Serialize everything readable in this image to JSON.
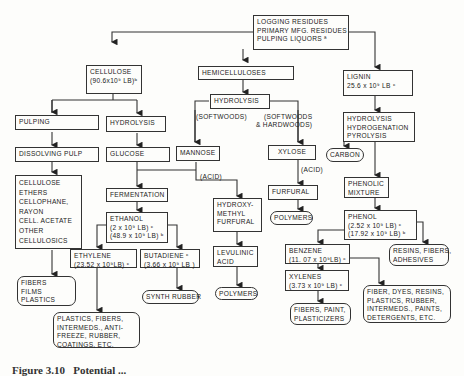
{
  "diagram": {
    "nodes": {
      "source": "LOGGING RESIDUES\nPRIMARY MFG. RESIDUES\nPULPING LIQUORS ª",
      "cellulose": "CELLULOSE\n(90.6x10⁹ LB)ᵇ",
      "hemicelluloses": "HEMICELLULOSES",
      "lignin": "LIGNIN\n25.6 x 10⁹ LB ᶜ",
      "pulping": "PULPING",
      "hydrolysis_cell": "HYDROLYSIS",
      "hydrolysis_hemi": "HYDROLYSIS",
      "lignin_process": "HYDROLYSIS\nHYDROGENATION\nPYROLYSIS",
      "dissolving_pulp": "DISSOLVING PULP",
      "glucose": "GLUCOSE",
      "mannose": "MANNOSE",
      "xylose": "XYLOSE",
      "carbon": "CARBON",
      "cellulosics": "CELLULOSE\nETHERS\nCELLOPHANE,\nRAYON\nCELL. ACETATE\nOTHER\nCELLULOSICS",
      "fermentation": "FERMENTATION",
      "hmf": "HYDROXY-\nMETHYL\nFURFURAL",
      "furfural": "FURFURAL",
      "polymers_furfural": "POLYMERS",
      "phenolic_mixture": "PHENOLIC\nMIXTURE",
      "ethanol": "ETHANOL\n(2 x 10⁹ LB) ᶜ\n(48.9 x 10⁹ LB) ᵇ",
      "levulinic": "LEVULINIC\nACID",
      "phenol": "PHENOL\n(2.52 x 10⁹ LB) ᶜ\n(17.92 x 10⁹ LB) ᵇ",
      "ethylene": "ETHYLENE\n(23.52 x 10⁹LB) ᶜ",
      "butadiene": "BUTADIENE ᶜ\n(3.66 x 10⁹ LB )",
      "polymers_levulinic": "POLYMERS",
      "benzene": "BENZENE\n(11. 07 x 10⁹LB) ᶜ",
      "resins": "RESINS, FIBERS,\nADHESIVES",
      "fibers_films": "FIBERS\nFILMS\nPLASTICS",
      "synth_rubber": "SYNTH RUBBER",
      "xylenes": "XYLENES\n(3.73 x 10⁹ LB) ᶜ",
      "fiber_dyes": "FIBER, DYES, RESINS,\nPLASTICS, RUBBER,\nINTERMEDS., PAINTS,\nDETERGENTS, ETC.",
      "fibers_paint": "FIBERS, PAINT,\nPLASTICIZERS",
      "plastics_fibers": "PLASTICS, FIBERS,\nINTERMEDS., ANTI-\nFREEZE, RUBBER,\nCOATINGS, ETC,"
    },
    "edge_labels": {
      "softwoods": "(SOFTWOODS)",
      "soft_hard": "(SOFTWOODS\n& HARDWOODS)",
      "acid_mannose": "(ACID)",
      "acid_xylose": "(ACID)"
    },
    "caption": "Figure 3.10   Potential ..."
  }
}
